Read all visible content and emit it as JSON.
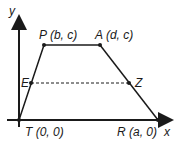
{
  "diagram": {
    "type": "coordinate-geometry trapezoid",
    "axes": {
      "x_label": "x",
      "y_label": "y"
    },
    "points": {
      "T": {
        "label": "T (0, 0)"
      },
      "P": {
        "label": "P (b, c)"
      },
      "A": {
        "label": "A (d, c)"
      },
      "R": {
        "label": "R (a, 0)"
      },
      "E": {
        "label": "E"
      },
      "Z": {
        "label": "Z"
      }
    },
    "segments": [
      "TP",
      "PA",
      "AR",
      "RT"
    ],
    "dashed_segments": [
      "EZ"
    ],
    "colors": {
      "stroke": "#1a1a1a",
      "background": "#ffffff"
    }
  }
}
